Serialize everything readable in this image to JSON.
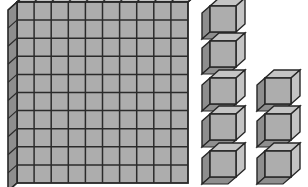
{
  "scene": {
    "title": "Base-ten blocks place value model",
    "background_color": "#ffffff",
    "width": 308,
    "height": 187
  },
  "palette": {
    "front_face": "#adadad",
    "top_face": "#c4c4c4",
    "side_face": "#8e8e8e",
    "outline": "#262626",
    "grid_line": "#2b2b2b"
  },
  "flat": {
    "label": "hundreds-flat",
    "rows": 10,
    "columns": 10,
    "unit_count": 100,
    "place_value": "hundreds",
    "x": 17,
    "y": 2,
    "width": 171,
    "height": 181,
    "depth_x": 10,
    "depth_y": 9
  },
  "units": {
    "label": "unit-cubes",
    "place_value": "ones",
    "count": 8,
    "cube_size": 26,
    "depth_x": 9,
    "depth_y": 8,
    "positions": [
      {
        "id": "unit-cube-1",
        "x": 210,
        "y": 6
      },
      {
        "id": "unit-cube-2",
        "x": 210,
        "y": 41
      },
      {
        "id": "unit-cube-3",
        "x": 210,
        "y": 78
      },
      {
        "id": "unit-cube-4",
        "x": 210,
        "y": 114
      },
      {
        "id": "unit-cube-5",
        "x": 210,
        "y": 151
      },
      {
        "id": "unit-cube-6",
        "x": 265,
        "y": 78
      },
      {
        "id": "unit-cube-7",
        "x": 265,
        "y": 114
      },
      {
        "id": "unit-cube-8",
        "x": 265,
        "y": 151
      }
    ]
  },
  "total": {
    "hundreds": 1,
    "tens": 0,
    "ones": 8,
    "value": 108
  }
}
